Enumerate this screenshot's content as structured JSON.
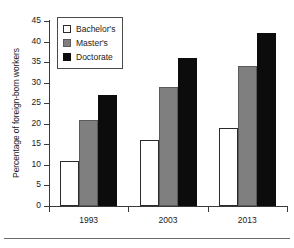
{
  "chart_data": {
    "type": "bar",
    "title": "",
    "subtitle": "",
    "xlabel": "",
    "ylabel": "Percentage of foreign-born workers",
    "categories": [
      "1993",
      "2003",
      "2013"
    ],
    "series": [
      {
        "name": "Bachelor's",
        "color": "#ffffff",
        "values": [
          11,
          16,
          19
        ]
      },
      {
        "name": "Master's",
        "color": "#7f7f7f",
        "values": [
          21,
          29,
          34
        ]
      },
      {
        "name": "Doctorate",
        "color": "#0c0c0c",
        "values": [
          27,
          36,
          42
        ]
      }
    ],
    "ylim": [
      0,
      45
    ],
    "ytick_values": [
      0,
      5,
      10,
      15,
      20,
      25,
      30,
      35,
      40,
      45
    ],
    "ytick_labels": [
      "0",
      "5",
      "10",
      "15",
      "20",
      "25",
      "30",
      "35",
      "40",
      "45"
    ],
    "grid": false,
    "legend_position": "top-left-inside",
    "annotations": []
  },
  "legend": {
    "items": [
      {
        "label": "Bachelor's",
        "swatch": "white-square-icon"
      },
      {
        "label": "Master's",
        "swatch": "gray-square-icon"
      },
      {
        "label": "Doctorate",
        "swatch": "black-square-icon"
      }
    ]
  }
}
